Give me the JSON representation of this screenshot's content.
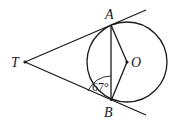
{
  "diagram": {
    "points": {
      "T": "T",
      "A": "A",
      "B": "B",
      "O": "O"
    },
    "angle_label": "67°",
    "angle_at": "B, between TB and AB",
    "stroke_color": "#1a1a1a"
  }
}
